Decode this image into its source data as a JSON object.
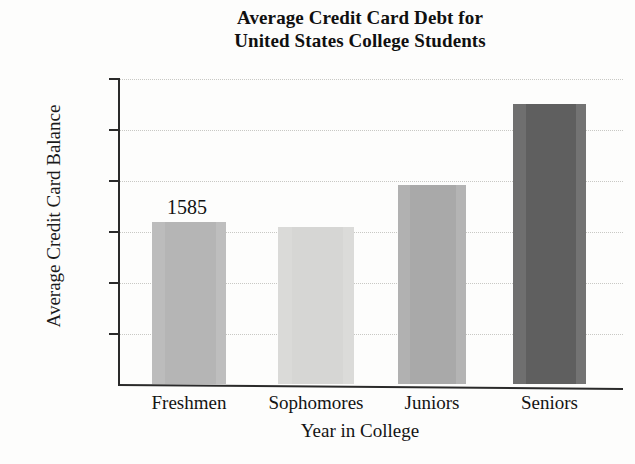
{
  "chart_data": {
    "type": "bar",
    "title": "Average Credit Card Debt for United States College Students",
    "title_lines": [
      "Average Credit Card Debt for",
      "United States College Students"
    ],
    "xlabel": "Year in College",
    "ylabel": "Average Credit Card Balance",
    "categories": [
      "Freshmen",
      "Sophomores",
      "Juniors",
      "Seniors"
    ],
    "values": [
      1585,
      1540,
      1950,
      2750
    ],
    "data_labels": [
      {
        "category": "Freshmen",
        "text": "1585"
      }
    ],
    "ylim": [
      0,
      3000
    ],
    "ytick_values": [
      500,
      1000,
      1500,
      2000,
      2500,
      3000
    ],
    "ytick_labels": [
      "$500",
      "$1000",
      "$1500",
      "$2000",
      "$2500",
      "$3000"
    ],
    "grid": "horizontal-dotted",
    "legend": "none",
    "bar_colors": [
      "#b5b5b5",
      "#d6d6d4",
      "#a9a9a9",
      "#5f5f5f"
    ],
    "axis_color": "#2a2a2a",
    "gridline_color": "#c8c8c4",
    "background_color": "#fdfdfc"
  }
}
